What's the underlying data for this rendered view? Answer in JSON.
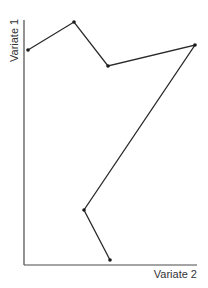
{
  "chart_data": {
    "type": "line",
    "title": "",
    "xlabel": "Variate 2",
    "ylabel": "Variate 1",
    "grid": false,
    "legend": null,
    "ticks": {
      "x": [],
      "y": []
    },
    "xlim": [
      0,
      100
    ],
    "ylim": [
      0,
      100
    ],
    "series": [
      {
        "name": "path",
        "points": [
          {
            "x": 2,
            "y": 87
          },
          {
            "x": 29,
            "y": 98
          },
          {
            "x": 49,
            "y": 81
          },
          {
            "x": 99,
            "y": 89
          },
          {
            "x": 35,
            "y": 22
          },
          {
            "x": 50,
            "y": 2
          }
        ]
      }
    ]
  },
  "axes": {
    "x_label": "Variate 2",
    "y_label": "Variate 1"
  },
  "pixel_layout": {
    "origin": [
      24,
      265
    ],
    "x_end": 197,
    "y_top": 20,
    "points_px": [
      [
        28,
        50
      ],
      [
        74,
        22
      ],
      [
        108,
        66
      ],
      [
        195,
        45
      ],
      [
        84,
        210
      ],
      [
        110,
        260
      ]
    ]
  }
}
